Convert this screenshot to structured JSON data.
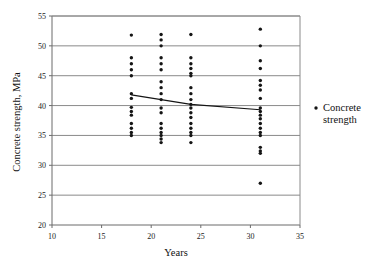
{
  "chart_data": {
    "type": "scatter",
    "title": "",
    "xlabel": "Years",
    "ylabel": "Concrete strength, MPa",
    "xlim": [
      10,
      35
    ],
    "ylim": [
      20,
      55
    ],
    "xticks": [
      10,
      15,
      20,
      25,
      30,
      35
    ],
    "yticks": [
      20,
      25,
      30,
      35,
      40,
      45,
      50,
      55
    ],
    "grid": "horizontal",
    "legend_position": "right",
    "legend": [
      "Concrete strength"
    ],
    "legend_lines": [
      "Concrete",
      "strength"
    ],
    "series": [
      {
        "name": "Concrete strength",
        "marker": "dot",
        "color": "#151515",
        "points": [
          {
            "x": 18,
            "y": 51.8
          },
          {
            "x": 18,
            "y": 48.0
          },
          {
            "x": 18,
            "y": 47.0
          },
          {
            "x": 18,
            "y": 46.0
          },
          {
            "x": 18,
            "y": 45.0
          },
          {
            "x": 18,
            "y": 42.0
          },
          {
            "x": 18,
            "y": 41.2
          },
          {
            "x": 18,
            "y": 39.7
          },
          {
            "x": 18,
            "y": 39.0
          },
          {
            "x": 18,
            "y": 38.4
          },
          {
            "x": 18,
            "y": 37.0
          },
          {
            "x": 18,
            "y": 36.2
          },
          {
            "x": 18,
            "y": 35.5
          },
          {
            "x": 18,
            "y": 35.0
          },
          {
            "x": 21,
            "y": 51.9
          },
          {
            "x": 21,
            "y": 51.0
          },
          {
            "x": 21,
            "y": 50.0
          },
          {
            "x": 21,
            "y": 48.0
          },
          {
            "x": 21,
            "y": 47.0
          },
          {
            "x": 21,
            "y": 46.0
          },
          {
            "x": 21,
            "y": 44.0
          },
          {
            "x": 21,
            "y": 43.0
          },
          {
            "x": 21,
            "y": 42.0
          },
          {
            "x": 21,
            "y": 41.0
          },
          {
            "x": 21,
            "y": 39.6
          },
          {
            "x": 21,
            "y": 38.8
          },
          {
            "x": 21,
            "y": 37.0
          },
          {
            "x": 21,
            "y": 36.2
          },
          {
            "x": 21,
            "y": 35.5
          },
          {
            "x": 21,
            "y": 35.0
          },
          {
            "x": 21,
            "y": 34.4
          },
          {
            "x": 21,
            "y": 33.8
          },
          {
            "x": 24,
            "y": 51.9
          },
          {
            "x": 24,
            "y": 48.0
          },
          {
            "x": 24,
            "y": 47.0
          },
          {
            "x": 24,
            "y": 46.2
          },
          {
            "x": 24,
            "y": 45.4
          },
          {
            "x": 24,
            "y": 45.0
          },
          {
            "x": 24,
            "y": 43.0
          },
          {
            "x": 24,
            "y": 42.0
          },
          {
            "x": 24,
            "y": 41.0
          },
          {
            "x": 24,
            "y": 40.2
          },
          {
            "x": 24,
            "y": 39.6
          },
          {
            "x": 24,
            "y": 38.8
          },
          {
            "x": 24,
            "y": 38.0
          },
          {
            "x": 24,
            "y": 37.0
          },
          {
            "x": 24,
            "y": 36.2
          },
          {
            "x": 24,
            "y": 35.5
          },
          {
            "x": 24,
            "y": 35.0
          },
          {
            "x": 24,
            "y": 33.8
          },
          {
            "x": 31,
            "y": 52.8
          },
          {
            "x": 31,
            "y": 50.0
          },
          {
            "x": 31,
            "y": 47.5
          },
          {
            "x": 31,
            "y": 46.2
          },
          {
            "x": 31,
            "y": 44.2
          },
          {
            "x": 31,
            "y": 43.4
          },
          {
            "x": 31,
            "y": 42.6
          },
          {
            "x": 31,
            "y": 41.2
          },
          {
            "x": 31,
            "y": 39.6
          },
          {
            "x": 31,
            "y": 39.0
          },
          {
            "x": 31,
            "y": 38.4
          },
          {
            "x": 31,
            "y": 37.8
          },
          {
            "x": 31,
            "y": 37.0
          },
          {
            "x": 31,
            "y": 36.2
          },
          {
            "x": 31,
            "y": 35.5
          },
          {
            "x": 31,
            "y": 35.0
          },
          {
            "x": 31,
            "y": 33.0
          },
          {
            "x": 31,
            "y": 32.4
          },
          {
            "x": 31,
            "y": 32.0
          },
          {
            "x": 31,
            "y": 27.0
          }
        ]
      }
    ],
    "trendline": {
      "name": "trend",
      "color": "#151515",
      "points": [
        {
          "x": 18,
          "y": 41.8
        },
        {
          "x": 21,
          "y": 41.0
        },
        {
          "x": 24,
          "y": 40.2
        },
        {
          "x": 31,
          "y": 39.3
        }
      ]
    }
  }
}
